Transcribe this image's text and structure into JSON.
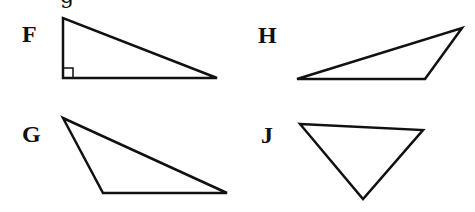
{
  "header": {
    "cutoff_text": "g"
  },
  "options": [
    {
      "label": "F",
      "type": "right triangle",
      "label_pos": [
        22,
        22
      ],
      "vertices": [
        [
          63,
          18
        ],
        [
          63,
          78
        ],
        [
          217,
          78
        ]
      ],
      "right_angle_marker": {
        "x": 63,
        "y": 68,
        "size": 10
      }
    },
    {
      "label": "H",
      "type": "obtuse triangle",
      "label_pos": [
        258,
        23
      ],
      "vertices": [
        [
          297,
          79
        ],
        [
          462,
          28
        ],
        [
          425,
          79
        ]
      ]
    },
    {
      "label": "G",
      "type": "obtuse triangle",
      "label_pos": [
        22,
        122
      ],
      "vertices": [
        [
          63,
          118
        ],
        [
          103,
          193
        ],
        [
          227,
          193
        ]
      ]
    },
    {
      "label": "J",
      "type": "acute triangle",
      "label_pos": [
        261,
        123
      ],
      "vertices": [
        [
          300,
          124
        ],
        [
          423,
          130
        ],
        [
          363,
          199
        ]
      ]
    }
  ],
  "style": {
    "stroke": "#111111",
    "stroke_width": 2.5,
    "background": "#ffffff"
  }
}
